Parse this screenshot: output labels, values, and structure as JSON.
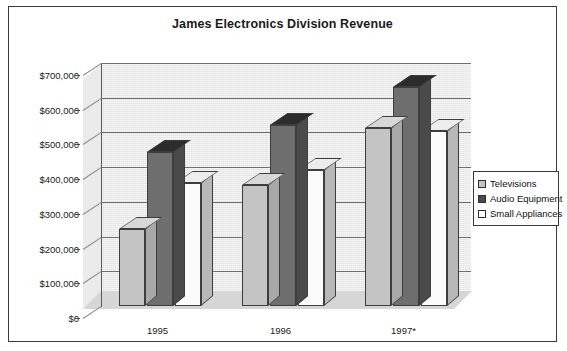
{
  "chart_data": {
    "type": "bar",
    "title": "James Electronics Division Revenue",
    "xlabel": "",
    "ylabel": "",
    "categories": [
      "1995",
      "1996",
      "1997*"
    ],
    "series": [
      {
        "name": "Televisions",
        "values": [
          223000,
          348000,
          512000
        ],
        "color": "#c4c4c4"
      },
      {
        "name": "Audio Equipment",
        "values": [
          443000,
          520000,
          630000
        ],
        "color": "#4a4a4a"
      },
      {
        "name": "Small Appliances",
        "values": [
          355000,
          392000,
          503000
        ],
        "color": "#ffffff"
      }
    ],
    "ylim": [
      0,
      700000
    ],
    "ytick_values": [
      0,
      100000,
      200000,
      300000,
      400000,
      500000,
      600000,
      700000
    ],
    "ytick_labels": [
      "$0",
      "$100,000",
      "$200,000",
      "$300,000",
      "$400,000",
      "$500,000",
      "$600,000",
      "$700,000"
    ],
    "grid": true,
    "legend_position": "right",
    "three_d": true,
    "plot_background": "#e2e2e2",
    "border_color": "#3a3a3a"
  },
  "legend": {
    "items": [
      {
        "label": "Televisions"
      },
      {
        "label": "Audio Equipment"
      },
      {
        "label": "Small Appliances"
      }
    ]
  }
}
